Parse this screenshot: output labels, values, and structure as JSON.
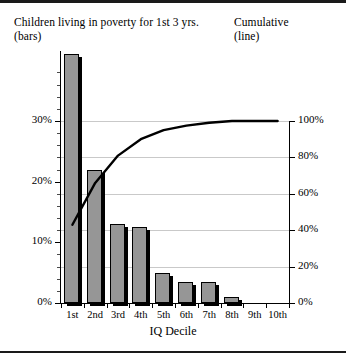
{
  "header": {
    "left_line1": "Children living in poverty for 1st 3 yrs.",
    "left_line2": "(bars)",
    "right_line1": "Cumulative",
    "right_line2": "(line)"
  },
  "colors": {
    "bar_fill": "#969696",
    "bar_outline": "#000000",
    "line": "#000000",
    "gridline": "#c9c9c9",
    "axis": "#000000",
    "background": "#ffffff"
  },
  "chart_data": {
    "type": "bar",
    "title": "Children living in poverty for 1st 3 yrs. (bars)",
    "subtitle": "Cumulative (line)",
    "xlabel": "IQ Decile",
    "ylabel": "",
    "categories": [
      "1st",
      "2nd",
      "3rd",
      "4th",
      "5th",
      "6th",
      "7th",
      "8th",
      "9th",
      "10th"
    ],
    "grid": true,
    "legend": "none",
    "series": [
      {
        "name": "Children living in poverty for 1st 3 yrs.",
        "type": "bar",
        "axis": "left",
        "values": [
          41,
          22,
          13,
          12.5,
          5,
          3.5,
          3.5,
          1,
          0,
          0
        ]
      },
      {
        "name": "Cumulative",
        "type": "line",
        "axis": "right",
        "values": [
          43,
          66,
          81,
          90,
          95,
          97.5,
          99,
          100,
          100,
          100
        ]
      }
    ],
    "left_axis": {
      "label": "",
      "ylim": [
        0,
        45
      ],
      "major_ticks": [
        0,
        10,
        20,
        30
      ],
      "tick_labels": [
        "0%",
        "10%",
        "20%",
        "30%"
      ],
      "minor_tick_interval": 2
    },
    "right_axis": {
      "label": "",
      "ylim": [
        0,
        100
      ],
      "major_ticks": [
        0,
        20,
        40,
        60,
        80,
        100
      ],
      "tick_labels": [
        "0%",
        "20%",
        "40%",
        "60%",
        "80%",
        "100%"
      ]
    }
  }
}
